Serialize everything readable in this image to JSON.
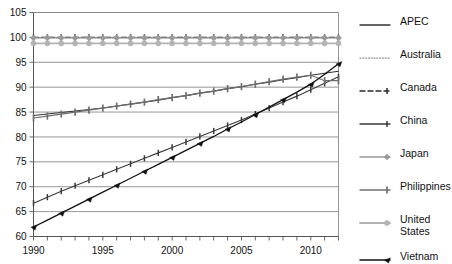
{
  "chart_data": {
    "type": "line",
    "title": "",
    "subtitle": "",
    "xlabel": "",
    "ylabel": "",
    "xlim": [
      1990,
      2012
    ],
    "ylim": [
      60,
      105
    ],
    "ytick_step": 5,
    "yticks": [
      60,
      65,
      70,
      75,
      80,
      85,
      90,
      95,
      100,
      105
    ],
    "xticks": [
      1990,
      1995,
      2000,
      2005,
      2010
    ],
    "xtick_all": [
      1990,
      1991,
      1992,
      1993,
      1994,
      1995,
      1996,
      1997,
      1998,
      1999,
      2000,
      2001,
      2002,
      2003,
      2004,
      2005,
      2006,
      2007,
      2008,
      2009,
      2010,
      2011,
      2012
    ],
    "grid": "horizontal",
    "legend_position": "right",
    "x": [
      1990,
      1991,
      1992,
      1993,
      1994,
      1995,
      1996,
      1997,
      1998,
      1999,
      2000,
      2001,
      2002,
      2003,
      2004,
      2005,
      2006,
      2007,
      2008,
      2009,
      2010,
      2011,
      2012
    ],
    "series": [
      {
        "name": "APEC",
        "color": "#333333",
        "dash": "none",
        "marker": "none",
        "width": 1.1,
        "values": [
          84.3,
          84.6,
          84.9,
          85.2,
          85.5,
          85.8,
          86.2,
          86.6,
          87.0,
          87.4,
          87.9,
          88.3,
          88.8,
          89.2,
          89.7,
          90.1,
          90.6,
          91.0,
          91.5,
          91.9,
          92.4,
          92.8,
          93.2
        ]
      },
      {
        "name": "Australia",
        "color": "#8c8c8c",
        "dash": "dotted",
        "marker": "none",
        "width": 1.0,
        "values": [
          99.9,
          99.9,
          99.9,
          99.9,
          99.9,
          99.9,
          99.9,
          99.9,
          99.9,
          99.9,
          99.9,
          99.9,
          99.9,
          99.9,
          99.9,
          99.9,
          99.9,
          99.9,
          99.9,
          99.9,
          99.9,
          99.9,
          99.9
        ]
      },
      {
        "name": "Canada",
        "color": "#2b2b2b",
        "dash": "dashed",
        "marker": "tick",
        "width": 1.2,
        "values": [
          100,
          100,
          100,
          100,
          100,
          100,
          100,
          100,
          100,
          100,
          100,
          100,
          100,
          100,
          100,
          100,
          100,
          100,
          100,
          100,
          100,
          100,
          100
        ]
      },
      {
        "name": "China",
        "color": "#3a3a3a",
        "dash": "none",
        "marker": "tick",
        "width": 1.1,
        "values": [
          66.7,
          67.9,
          69.1,
          70.2,
          71.3,
          72.4,
          73.5,
          74.6,
          75.7,
          76.8,
          77.9,
          79.0,
          80.1,
          81.2,
          82.3,
          83.4,
          84.6,
          85.8,
          87.0,
          88.2,
          89.5,
          90.8,
          92.1
        ]
      },
      {
        "name": "Japan",
        "color": "#9a9a9a",
        "dash": "none",
        "marker": "diamond",
        "width": 1.2,
        "values": [
          99.9,
          99.9,
          99.9,
          99.9,
          99.9,
          99.9,
          99.9,
          99.9,
          99.9,
          99.9,
          99.9,
          99.9,
          99.9,
          99.9,
          99.9,
          99.9,
          99.9,
          99.9,
          99.9,
          99.9,
          99.9,
          99.9,
          99.9
        ]
      },
      {
        "name": "Philippines",
        "color": "#6e6e6e",
        "dash": "none",
        "marker": "bar",
        "width": 1.2,
        "values": [
          83.8,
          84.2,
          84.6,
          85.0,
          85.4,
          85.8,
          86.2,
          86.6,
          87.0,
          87.5,
          87.9,
          88.3,
          88.8,
          89.2,
          89.7,
          90.1,
          90.6,
          91.1,
          91.6,
          92.0,
          92.4,
          91.3,
          91.3
        ]
      },
      {
        "name": "United States",
        "color": "#b3b3b3",
        "dash": "none",
        "marker": "circle",
        "width": 1.6,
        "values": [
          98.8,
          98.8,
          98.8,
          98.8,
          98.8,
          98.8,
          98.8,
          98.8,
          98.8,
          98.8,
          98.8,
          98.8,
          98.8,
          98.8,
          98.8,
          98.8,
          98.8,
          98.8,
          98.8,
          98.8,
          98.8,
          98.8,
          98.8
        ]
      },
      {
        "name": "Vietnam",
        "color": "#111111",
        "dash": "none",
        "marker": "arrow",
        "width": 1.3,
        "values": [
          61.9,
          63.3,
          64.7,
          66.1,
          67.5,
          68.9,
          70.3,
          71.7,
          73.1,
          74.5,
          75.9,
          77.3,
          78.7,
          80.1,
          81.6,
          83.0,
          84.5,
          86.0,
          87.5,
          89.0,
          90.6,
          92.6,
          94.7
        ]
      }
    ]
  },
  "legend": {
    "items": [
      {
        "label": "APEC",
        "key": "apec"
      },
      {
        "label": "Australia",
        "key": "australia"
      },
      {
        "label": "Canada",
        "key": "canada"
      },
      {
        "label": "China",
        "key": "china"
      },
      {
        "label": "Japan",
        "key": "japan"
      },
      {
        "label": "Philippines",
        "key": "philippines"
      },
      {
        "label": "United\nStates",
        "key": "united-states"
      },
      {
        "label": "Vietnam",
        "key": "vietnam"
      }
    ]
  },
  "axes": {
    "y_labels": [
      "105",
      "100",
      "95",
      "90",
      "85",
      "80",
      "75",
      "70",
      "65",
      "60"
    ],
    "x_labels": [
      "1990",
      "1995",
      "2000",
      "2005",
      "2010"
    ]
  }
}
